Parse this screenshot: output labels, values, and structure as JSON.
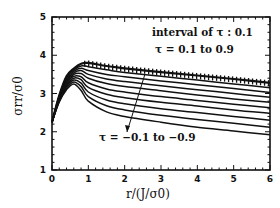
{
  "chart_data": {
    "type": "line",
    "title": "",
    "xlabel": "r/(J/σ0)",
    "ylabel": "σrr/σ0",
    "xlim": [
      0,
      6
    ],
    "ylim": [
      1,
      5
    ],
    "x_ticks": [
      "0",
      "1",
      "2",
      "3",
      "4",
      "5",
      "6"
    ],
    "y_ticks": [
      "1",
      "2",
      "3",
      "4",
      "5"
    ],
    "grid": false,
    "legend": null,
    "annotations": [
      {
        "text": "interval of τ : 0.1",
        "x": 3.6,
        "y": 4.5
      },
      {
        "text": "τ = 0.1 to 0.9",
        "x": 3.7,
        "y": 4.05
      },
      {
        "text": "τ = −0.1 to −0.9",
        "x": 3.5,
        "y": 1.55,
        "arrow_to": [
          2.55,
          3.5
        ]
      }
    ],
    "x": [
      0,
      0.2,
      0.4,
      0.6,
      0.8,
      1.0,
      1.5,
      2.0,
      3.0,
      4.0,
      5.0,
      6.0
    ],
    "series": [
      {
        "name": "τ = 0.1 to 0.9 (envelope, hatched)",
        "values": [
          2.25,
          2.95,
          3.45,
          3.65,
          3.78,
          3.8,
          3.72,
          3.66,
          3.56,
          3.47,
          3.38,
          3.28
        ]
      },
      {
        "name": "τ = -0.1",
        "values": [
          2.25,
          2.95,
          3.42,
          3.62,
          3.72,
          3.7,
          3.62,
          3.55,
          3.45,
          3.35,
          3.25,
          3.15
        ]
      },
      {
        "name": "τ = -0.2",
        "values": [
          2.25,
          2.93,
          3.38,
          3.58,
          3.66,
          3.6,
          3.5,
          3.44,
          3.33,
          3.23,
          3.13,
          3.03
        ]
      },
      {
        "name": "τ = -0.3",
        "values": [
          2.25,
          2.9,
          3.34,
          3.54,
          3.6,
          3.5,
          3.38,
          3.31,
          3.2,
          3.1,
          3.0,
          2.9
        ]
      },
      {
        "name": "τ = -0.4",
        "values": [
          2.25,
          2.88,
          3.3,
          3.5,
          3.52,
          3.4,
          3.26,
          3.18,
          3.07,
          2.96,
          2.86,
          2.77
        ]
      },
      {
        "name": "τ = -0.5",
        "values": [
          2.25,
          2.86,
          3.26,
          3.45,
          3.44,
          3.28,
          3.12,
          3.04,
          2.92,
          2.82,
          2.72,
          2.63
        ]
      },
      {
        "name": "τ = -0.6",
        "values": [
          2.25,
          2.84,
          3.22,
          3.4,
          3.36,
          3.16,
          2.98,
          2.89,
          2.77,
          2.67,
          2.57,
          2.48
        ]
      },
      {
        "name": "τ = -0.7",
        "values": [
          2.25,
          2.82,
          3.18,
          3.35,
          3.27,
          3.04,
          2.83,
          2.73,
          2.6,
          2.5,
          2.4,
          2.3
        ]
      },
      {
        "name": "τ = -0.8",
        "values": [
          2.25,
          2.8,
          3.14,
          3.3,
          3.18,
          2.92,
          2.68,
          2.57,
          2.43,
          2.32,
          2.22,
          2.12
        ]
      },
      {
        "name": "τ = -0.9",
        "values": [
          2.25,
          2.78,
          3.1,
          3.25,
          3.08,
          2.8,
          2.52,
          2.4,
          2.25,
          2.12,
          2.02,
          1.92
        ]
      }
    ]
  },
  "labels": {
    "annotation_1": "interval of τ : 0.1",
    "annotation_2": "τ = 0.1 to 0.9",
    "annotation_3": "τ = −0.1 to −0.9"
  }
}
